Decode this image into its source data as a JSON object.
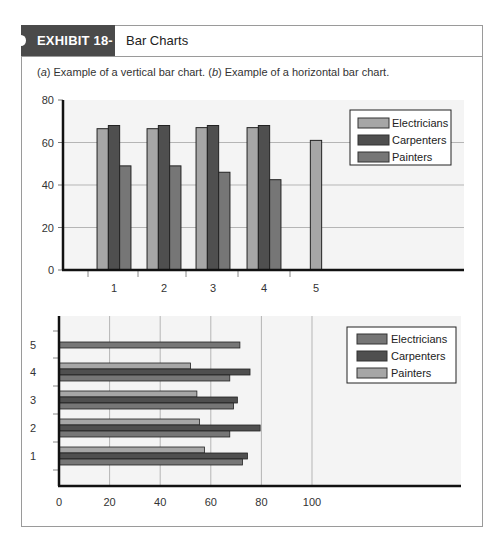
{
  "exhibit": {
    "tag": "EXHIBIT 18-7",
    "title": "Bar Charts",
    "caption_a_marker": "a",
    "caption_a": " Example of a vertical bar chart. (",
    "caption_b_marker": "b",
    "caption_b": ") Example of a horizontal bar chart.",
    "caption_open": "("
  },
  "colors": {
    "light": "#a6a6a6",
    "dark": "#4f4f4f",
    "medium": "#767676",
    "plot_bg": "#f4f4f4",
    "grid": "#b5b5b5",
    "axis": "#111111",
    "header_tab": "#4a4a4a"
  },
  "chart_data": [
    {
      "type": "bar",
      "orientation": "vertical",
      "title": "(a) Example of a vertical bar chart",
      "categories": [
        "1",
        "2",
        "3",
        "4",
        "5"
      ],
      "series": [
        {
          "name": "Electricians",
          "color": "#a6a6a6",
          "values": [
            66.5,
            66.5,
            67,
            67,
            61
          ]
        },
        {
          "name": "Carpenters",
          "color": "#4f4f4f",
          "values": [
            68,
            68,
            68,
            68,
            null
          ]
        },
        {
          "name": "Painters",
          "color": "#767676",
          "values": [
            49,
            49,
            46,
            42.5,
            null
          ]
        }
      ],
      "xlabel": "",
      "ylabel": "",
      "ylim": [
        0,
        80
      ],
      "yticks": [
        0,
        20,
        40,
        60,
        80
      ],
      "grid": true,
      "legend_position": "upper right",
      "legend": [
        "Electricians",
        "Carpenters",
        "Painters"
      ]
    },
    {
      "type": "bar",
      "orientation": "horizontal",
      "title": "(b) Example of a horizontal bar chart",
      "categories": [
        "1",
        "2",
        "3",
        "4",
        "5"
      ],
      "series": [
        {
          "name": "Electricians",
          "color": "#767676",
          "values": [
            72.5,
            67.5,
            69,
            67.5,
            71.5
          ]
        },
        {
          "name": "Carpenters",
          "color": "#4f4f4f",
          "values": [
            74.5,
            79.5,
            70.5,
            75.5,
            null
          ]
        },
        {
          "name": "Painters",
          "color": "#a6a6a6",
          "values": [
            57.5,
            55.5,
            54.5,
            52,
            null
          ]
        }
      ],
      "xlabel": "",
      "ylabel": "",
      "xlim": [
        0,
        100
      ],
      "xticks": [
        0,
        20,
        40,
        60,
        80,
        100
      ],
      "grid": true,
      "legend_position": "upper right",
      "legend": [
        "Electricians",
        "Carpenters",
        "Painters"
      ]
    }
  ]
}
